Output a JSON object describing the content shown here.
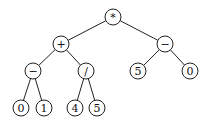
{
  "diagram": {
    "type": "expression-tree",
    "radius": 8,
    "nodes": [
      {
        "id": "root",
        "label": "*",
        "x": 113,
        "y": 17
      },
      {
        "id": "plus",
        "label": "+",
        "x": 61,
        "y": 44
      },
      {
        "id": "minus-right",
        "label": "−",
        "x": 165,
        "y": 44
      },
      {
        "id": "minus-left",
        "label": "−",
        "x": 33,
        "y": 71
      },
      {
        "id": "divide",
        "label": "/",
        "x": 86,
        "y": 71
      },
      {
        "id": "five-right",
        "label": "5",
        "x": 138,
        "y": 71
      },
      {
        "id": "zero-right",
        "label": "0",
        "x": 190,
        "y": 71
      },
      {
        "id": "zero-left",
        "label": "0",
        "x": 21,
        "y": 108
      },
      {
        "id": "one",
        "label": "1",
        "x": 44,
        "y": 108
      },
      {
        "id": "four",
        "label": "4",
        "x": 75,
        "y": 108
      },
      {
        "id": "five-left",
        "label": "5",
        "x": 97,
        "y": 108
      }
    ],
    "edges": [
      [
        "root",
        "plus"
      ],
      [
        "root",
        "minus-right"
      ],
      [
        "plus",
        "minus-left"
      ],
      [
        "plus",
        "divide"
      ],
      [
        "minus-right",
        "five-right"
      ],
      [
        "minus-right",
        "zero-right"
      ],
      [
        "minus-left",
        "zero-left"
      ],
      [
        "minus-left",
        "one"
      ],
      [
        "divide",
        "four"
      ],
      [
        "divide",
        "five-left"
      ]
    ]
  }
}
